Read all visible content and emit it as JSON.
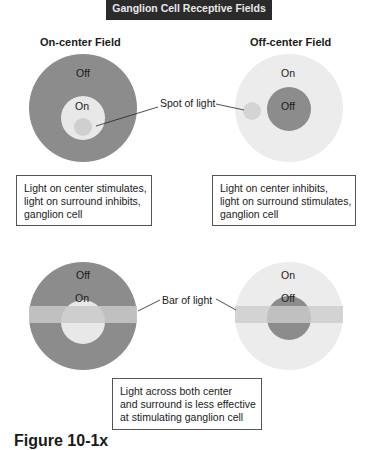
{
  "title": "Ganglion Cell Receptive Fields",
  "headings": {
    "on_center": "On-center Field",
    "off_center": "Off-center Field"
  },
  "colors": {
    "dark_field": "#8c8c8c",
    "light_field": "#e8e8e8",
    "light_spot": "#cfcfcf",
    "bar": "#cdcdcd",
    "title_bg": "#2b2b2b"
  },
  "top_row": {
    "left": {
      "surround": "Off",
      "center": "On"
    },
    "right": {
      "surround": "On",
      "center": "Off"
    },
    "pointer_label": "Spot of light",
    "left_caption": [
      "Light on center stimulates,",
      "light on surround inhibits,",
      "ganglion cell"
    ],
    "right_caption": [
      "Light on center inhibits,",
      "light on surround stimulates,",
      "ganglion cell"
    ]
  },
  "bottom_row": {
    "left": {
      "surround": "Off",
      "center": "On"
    },
    "right": {
      "surround": "On",
      "center": "Off"
    },
    "pointer_label": "Bar of light",
    "caption": [
      "Light across both center",
      "and surround is less effective",
      "at stimulating ganglion cell"
    ]
  },
  "figure_label": "Figure 10-1x"
}
